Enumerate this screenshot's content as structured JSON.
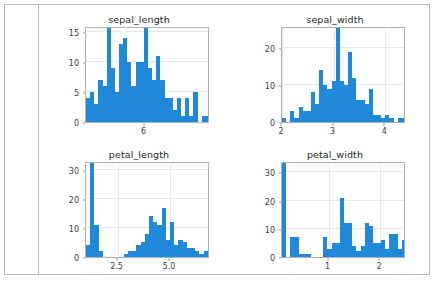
{
  "output_cell": {
    "gutter_label": "",
    "background": "#ffffff",
    "border_color": "#b8b8b8"
  },
  "figure": {
    "bar_color": "#1f88da",
    "axes_edge_color": "#b0b0b0",
    "grid_color": "#e8e8e8",
    "rows": 2,
    "cols": 2
  },
  "chart_data": [
    {
      "type": "bar",
      "title": "sepal_length",
      "xlabel": "",
      "ylabel": "",
      "grid": true,
      "xlim": [
        4.3,
        7.9
      ],
      "ylim": [
        0,
        16
      ],
      "xticks": [
        6,
        8
      ],
      "xticklabels": [
        "6",
        "8"
      ],
      "yticks": [
        0,
        5,
        10,
        15
      ],
      "yticklabels": [
        "0",
        "5",
        "10",
        "15"
      ],
      "bin_edges": [
        4.3,
        4.42,
        4.54,
        4.66,
        4.78,
        4.9,
        5.02,
        5.14,
        5.26,
        5.38,
        5.5,
        5.62,
        5.74,
        5.86,
        5.98,
        6.1,
        6.22,
        6.34,
        6.46,
        6.58,
        6.7,
        6.82,
        6.94,
        7.06,
        7.18,
        7.3,
        7.42,
        7.54,
        7.66,
        7.78,
        7.9
      ],
      "values": [
        4,
        5,
        3,
        7,
        6,
        16,
        9,
        5,
        13,
        14,
        10,
        6,
        10,
        10,
        16,
        9,
        7,
        11,
        7,
        4,
        4,
        2,
        4,
        1,
        4,
        1,
        5,
        0,
        1,
        1
      ]
    },
    {
      "type": "bar",
      "title": "sepal_width",
      "xlabel": "",
      "ylabel": "",
      "grid": true,
      "xlim": [
        2.0,
        4.4
      ],
      "ylim": [
        0,
        26
      ],
      "xticks": [
        2,
        3,
        4
      ],
      "xticklabels": [
        "2",
        "3",
        "4"
      ],
      "yticks": [
        0,
        10,
        20
      ],
      "yticklabels": [
        "0",
        "10",
        "20"
      ],
      "bin_edges": [
        2.0,
        2.08,
        2.16,
        2.24,
        2.32,
        2.4,
        2.48,
        2.56,
        2.64,
        2.72,
        2.8,
        2.88,
        2.96,
        3.04,
        3.12,
        3.2,
        3.28,
        3.36,
        3.44,
        3.52,
        3.6,
        3.68,
        3.76,
        3.84,
        3.92,
        4.0,
        4.08,
        4.16,
        4.24,
        4.32,
        4.4
      ],
      "values": [
        1,
        0,
        3,
        1,
        4,
        3,
        3,
        8,
        5,
        14,
        10,
        9,
        11,
        26,
        11,
        10,
        19,
        12,
        6,
        6,
        5,
        9,
        2,
        2,
        1,
        2,
        1,
        0,
        1,
        1
      ]
    },
    {
      "type": "bar",
      "title": "petal_length",
      "xlabel": "",
      "ylabel": "",
      "grid": true,
      "xlim": [
        1.0,
        6.9
      ],
      "ylim": [
        0,
        33
      ],
      "xticks": [
        2.5,
        5.0
      ],
      "xticklabels": [
        "2.5",
        "5.0"
      ],
      "yticks": [
        0,
        10,
        20,
        30
      ],
      "yticklabels": [
        "0",
        "10",
        "20",
        "30"
      ],
      "bin_edges": [
        1.0,
        1.2,
        1.4,
        1.6,
        1.8,
        2.0,
        2.2,
        2.4,
        2.6,
        2.8,
        3.0,
        3.2,
        3.4,
        3.6,
        3.8,
        4.0,
        4.2,
        4.4,
        4.6,
        4.8,
        5.0,
        5.2,
        5.4,
        5.6,
        5.8,
        6.0,
        6.2,
        6.4,
        6.6,
        6.8,
        6.9
      ],
      "values": [
        4,
        33,
        11,
        2,
        0,
        0,
        0,
        0,
        0,
        1,
        2,
        2,
        4,
        5,
        8,
        14,
        12,
        11,
        17,
        6,
        12,
        4,
        6,
        5,
        3,
        3,
        2,
        1,
        2,
        0
      ]
    },
    {
      "type": "bar",
      "title": "petal_width",
      "xlabel": "",
      "ylabel": "",
      "grid": true,
      "xlim": [
        0.1,
        2.5
      ],
      "ylim": [
        0,
        34
      ],
      "xticks": [
        0,
        1,
        2
      ],
      "xticklabels": [
        "0",
        "1",
        "2"
      ],
      "yticks": [
        0,
        10,
        20,
        30
      ],
      "yticklabels": [
        "0",
        "10",
        "20",
        "30"
      ],
      "bin_edges": [
        0.1,
        0.18,
        0.26,
        0.34,
        0.42,
        0.5,
        0.58,
        0.66,
        0.74,
        0.82,
        0.9,
        0.98,
        1.06,
        1.14,
        1.22,
        1.3,
        1.38,
        1.46,
        1.54,
        1.62,
        1.7,
        1.78,
        1.86,
        1.94,
        2.02,
        2.1,
        2.18,
        2.26,
        2.34,
        2.42,
        2.5
      ],
      "values": [
        34,
        0,
        7,
        7,
        1,
        1,
        1,
        0,
        0,
        0,
        7,
        3,
        5,
        5,
        21,
        12,
        12,
        4,
        2,
        4,
        12,
        11,
        5,
        5,
        6,
        3,
        8,
        8,
        3,
        6
      ]
    }
  ]
}
